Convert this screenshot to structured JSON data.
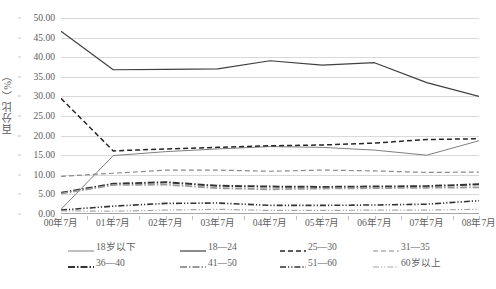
{
  "chart_data": {
    "type": "line",
    "title": "",
    "xlabel": "",
    "ylabel": "百分比（%）",
    "ylim": [
      0,
      50
    ],
    "ytick_step": 5,
    "grid": true,
    "legend_position": "bottom",
    "categories": [
      "00年7月",
      "01年7月",
      "02年7月",
      "03年7月",
      "04年7月",
      "05年7月",
      "06年7月",
      "07年7月",
      "08年7月"
    ],
    "ytick_labels": [
      "0.00",
      "5.00",
      "10.00",
      "15.00",
      "20.00",
      "25.00",
      "30.00",
      "35.00",
      "40.00",
      "45.00",
      "50.00"
    ],
    "series": [
      {
        "name": "18岁以下",
        "values": [
          1.2,
          14.9,
          15.9,
          16.6,
          17.2,
          17.0,
          16.3,
          15.0,
          18.7
        ],
        "color": "#808080",
        "width": 1.0,
        "dash": "none"
      },
      {
        "name": "18—24",
        "values": [
          46.6,
          36.8,
          36.9,
          37.0,
          39.1,
          38.0,
          38.6,
          33.5,
          30.0
        ],
        "color": "#404040",
        "width": 1.2,
        "dash": "none"
      },
      {
        "name": "25—30",
        "values": [
          29.5,
          16.1,
          16.6,
          17.0,
          17.4,
          17.6,
          18.1,
          19.0,
          19.2
        ],
        "color": "#262626",
        "width": 1.5,
        "dash": "5,3"
      },
      {
        "name": "31—35",
        "values": [
          9.6,
          10.4,
          11.2,
          11.2,
          10.9,
          11.2,
          11.0,
          10.6,
          10.7
        ],
        "color": "#8c8c8c",
        "width": 1.2,
        "dash": "5,3"
      },
      {
        "name": "36—40",
        "values": [
          5.4,
          7.7,
          8.1,
          7.2,
          7.0,
          6.9,
          7.0,
          7.1,
          7.6
        ],
        "color": "#333333",
        "width": 2.0,
        "dash": "7,2,1.5,2"
      },
      {
        "name": "41—50",
        "values": [
          5.2,
          7.4,
          7.5,
          6.6,
          6.3,
          6.5,
          6.6,
          6.7,
          6.8
        ],
        "color": "#999999",
        "width": 1.8,
        "dash": "7,2,1.5,2"
      },
      {
        "name": "51—60",
        "values": [
          1.0,
          2.0,
          2.7,
          2.8,
          2.2,
          2.2,
          2.3,
          2.5,
          3.4
        ],
        "color": "#333333",
        "width": 1.6,
        "dash": "6,2,1.2,2,1.2,2"
      },
      {
        "name": "60岁以上",
        "values": [
          0.8,
          0.7,
          1.0,
          1.2,
          0.9,
          0.9,
          1.0,
          1.0,
          1.2
        ],
        "color": "#a6a6a6",
        "width": 1.2,
        "dash": "6,2,1.2,2,1.2,2"
      }
    ]
  },
  "axis": {
    "y_title": "百分比（%）"
  },
  "legend": {
    "rows": [
      [
        "18岁以下",
        "18—24",
        "25—30",
        "31—35"
      ],
      [
        "36—40",
        "41—50",
        "51—60",
        "60岁以上"
      ]
    ]
  }
}
